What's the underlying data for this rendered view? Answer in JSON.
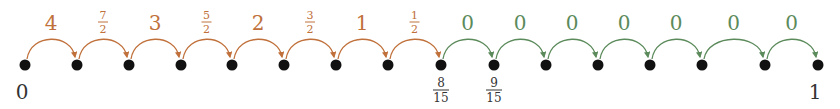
{
  "colors": {
    "orange": "#c0703a",
    "green": "#5b8a5b",
    "dot": "#111111",
    "label": "#333333"
  },
  "dots": [
    {
      "x": 25
    },
    {
      "x": 77
    },
    {
      "x": 129
    },
    {
      "x": 181
    },
    {
      "x": 232
    },
    {
      "x": 284
    },
    {
      "x": 336
    },
    {
      "x": 388
    },
    {
      "x": 441
    },
    {
      "x": 494
    },
    {
      "x": 546
    },
    {
      "x": 598
    },
    {
      "x": 650
    },
    {
      "x": 702
    },
    {
      "x": 765
    },
    {
      "x": 818
    }
  ],
  "arcs": [
    {
      "from": 0,
      "to": 1,
      "label": "4",
      "color": "orange"
    },
    {
      "from": 1,
      "to": 2,
      "label_num": "7",
      "label_den": "2",
      "color": "orange"
    },
    {
      "from": 2,
      "to": 3,
      "label": "3",
      "color": "orange"
    },
    {
      "from": 3,
      "to": 4,
      "label_num": "5",
      "label_den": "2",
      "color": "orange"
    },
    {
      "from": 4,
      "to": 5,
      "label": "2",
      "color": "orange"
    },
    {
      "from": 5,
      "to": 6,
      "label_num": "3",
      "label_den": "2",
      "color": "orange"
    },
    {
      "from": 6,
      "to": 7,
      "label": "1",
      "color": "orange"
    },
    {
      "from": 7,
      "to": 8,
      "label_num": "1",
      "label_den": "2",
      "color": "orange"
    },
    {
      "from": 8,
      "to": 9,
      "label": "0",
      "color": "green"
    },
    {
      "from": 9,
      "to": 10,
      "label": "0",
      "color": "green"
    },
    {
      "from": 10,
      "to": 11,
      "label": "0",
      "color": "green"
    },
    {
      "from": 11,
      "to": 12,
      "label": "0",
      "color": "green"
    },
    {
      "from": 12,
      "to": 13,
      "label": "0",
      "color": "green"
    },
    {
      "from": 13,
      "to": 14,
      "label": "0",
      "color": "green"
    },
    {
      "from": 14,
      "to": 15,
      "label": "0",
      "color": "green"
    }
  ],
  "axis_labels": [
    {
      "dot": 0,
      "text": "0"
    },
    {
      "dot": 8,
      "num": "8",
      "den": "15"
    },
    {
      "dot": 9,
      "num": "9",
      "den": "15"
    },
    {
      "dot": 15,
      "text": "1"
    }
  ]
}
